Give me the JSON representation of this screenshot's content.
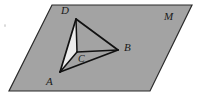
{
  "figure": {
    "canvas": {
      "width": 197,
      "height": 102
    },
    "colors": {
      "plane_fill": "#a3a3a3",
      "plane_stroke": "#2b2b2b",
      "face_acd_fill": "#ececec",
      "edge_stroke": "#111111",
      "label_color": "#1a1a1a",
      "background": "#ffffff"
    },
    "plane": {
      "name": "M",
      "shape": "parallelogram",
      "points": "52,5 192,5 150,91 9,91",
      "label": "M",
      "label_x": 165,
      "label_y": 14
    },
    "vertices": [
      {
        "id": "D",
        "label": "D",
        "x": 76,
        "y": 19,
        "label_x": 61,
        "label_y": 10
      },
      {
        "id": "A",
        "label": "A",
        "x": 60,
        "y": 72,
        "label_x": 46,
        "label_y": 79
      },
      {
        "id": "B",
        "label": "B",
        "x": 118,
        "y": 50,
        "label_x": 124,
        "label_y": 44
      },
      {
        "id": "C",
        "label": "C",
        "x": 77,
        "y": 52,
        "label_x": 79,
        "label_y": 54
      }
    ],
    "faces": [
      {
        "id": "ACD",
        "points": "60,72 77,52 76,19",
        "fill": "#ececec",
        "note": "front-left face, light fill"
      }
    ],
    "edges": [
      {
        "id": "AD",
        "from": "A",
        "to": "D",
        "style": "solid"
      },
      {
        "id": "DB",
        "from": "D",
        "to": "B",
        "style": "solid"
      },
      {
        "id": "AB",
        "from": "A",
        "to": "B",
        "style": "solid"
      },
      {
        "id": "AC",
        "from": "A",
        "to": "C",
        "style": "solid"
      },
      {
        "id": "CD",
        "from": "C",
        "to": "D",
        "style": "solid"
      },
      {
        "id": "CB",
        "from": "C",
        "to": "B",
        "style": "solid"
      }
    ]
  }
}
